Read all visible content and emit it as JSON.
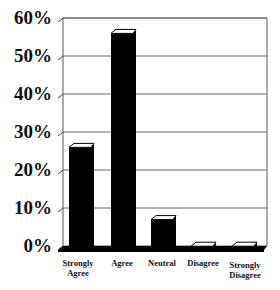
{
  "chart_data": {
    "type": "bar",
    "title": "",
    "xlabel": "",
    "ylabel": "",
    "categories": [
      "Strongly Agree",
      "Agree",
      "Neutral",
      "Disagree",
      "Strongly Disagree"
    ],
    "values": [
      27,
      57,
      8,
      1,
      1
    ],
    "ylim": [
      0,
      60
    ],
    "yticks": [
      "0%",
      "10%",
      "20%",
      "30%",
      "40%",
      "50%",
      "60%"
    ],
    "grid": true,
    "legend": "none",
    "bar_color": "#000000",
    "style": "3d"
  },
  "labels": {
    "x": [
      [
        "Strongly",
        "Agree"
      ],
      [
        "Agree"
      ],
      [
        "Neutral"
      ],
      [
        "Disagree"
      ],
      [
        "Strongly",
        "Disagree"
      ]
    ],
    "y": [
      "60%",
      "50%",
      "40%",
      "30%",
      "20%",
      "10%",
      "0%"
    ]
  }
}
